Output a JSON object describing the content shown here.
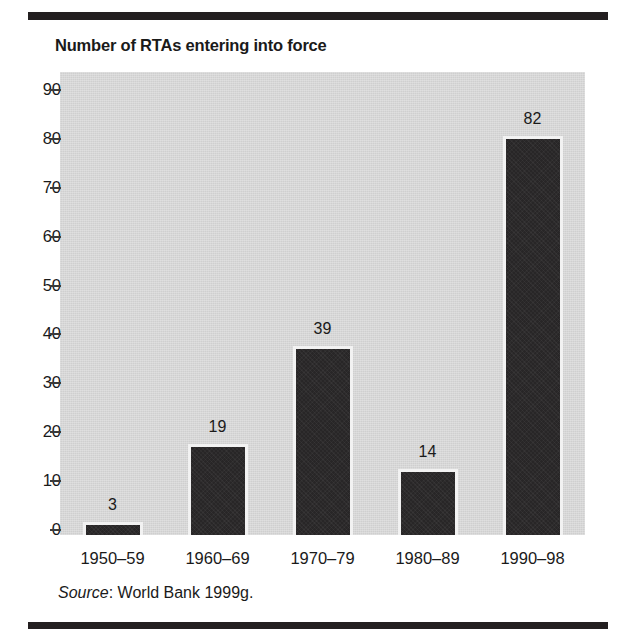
{
  "chart_data": {
    "type": "bar",
    "title": "Number of RTAs entering into force",
    "xlabel": "",
    "ylabel": "",
    "categories": [
      "1950–59",
      "1960–69",
      "1970–79",
      "1980–89",
      "1990–98"
    ],
    "values": [
      3,
      19,
      39,
      14,
      82
    ],
    "value_labels": [
      "3",
      "19",
      "39",
      "14",
      "82"
    ],
    "ylim": [
      0,
      90
    ],
    "yticks": [
      0,
      10,
      20,
      30,
      40,
      50,
      60,
      70,
      80,
      90
    ],
    "ytick_labels": [
      "0",
      "10",
      "20",
      "30",
      "40",
      "50",
      "60",
      "70",
      "80",
      "90"
    ],
    "grid": false,
    "legend": false,
    "bar_color": "#2c2a2b",
    "bar_border_color": "#f2f2f2",
    "plot_background": "#d6d6d6",
    "page_background": "#ffffff",
    "rule_color": "#231f20",
    "data_label_position": "above-bar"
  },
  "source": {
    "prefix": "Source",
    "separator": ": ",
    "text": "World Bank 1999g."
  }
}
